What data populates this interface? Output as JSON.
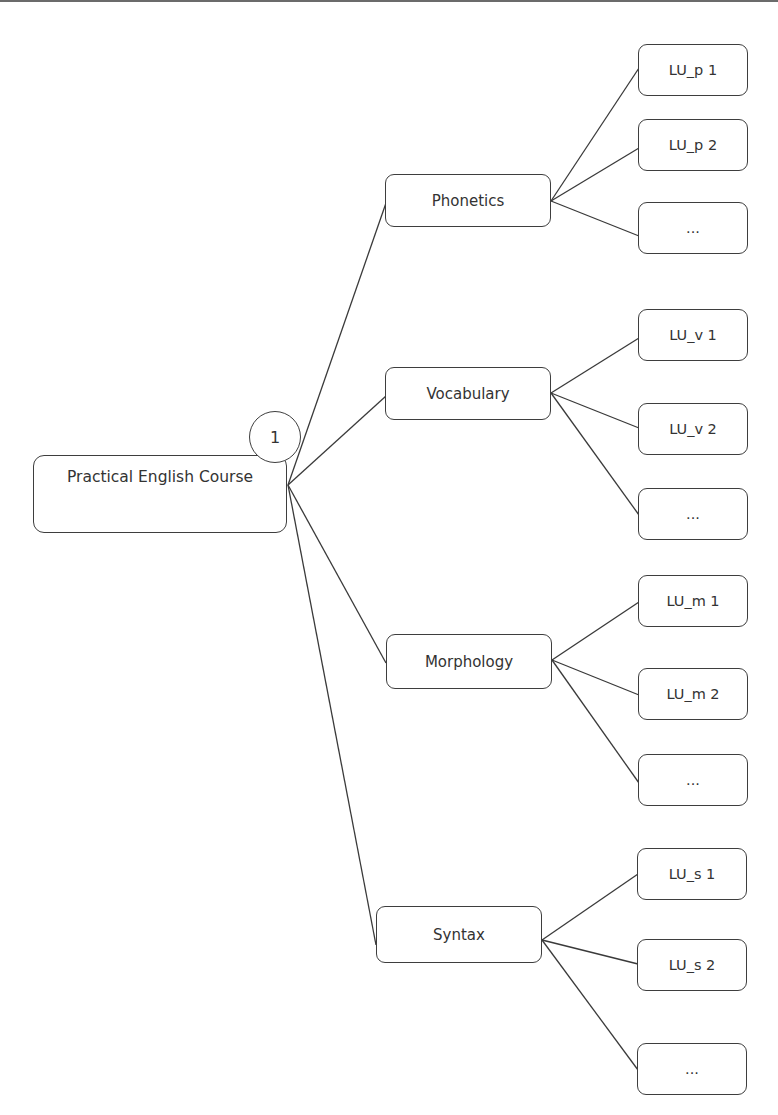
{
  "diagram": {
    "type": "tree",
    "root": {
      "label": "Practical English Course",
      "badge": "1",
      "box": {
        "x": 33,
        "y": 455,
        "w": 254,
        "h": 78
      },
      "badge_circle": {
        "cx": 275,
        "cy": 437,
        "r": 26
      }
    },
    "branches": [
      {
        "label": "Phonetics",
        "box": {
          "x": 385,
          "y": 174,
          "w": 166,
          "h": 53
        },
        "children": [
          {
            "label": "LU_p 1",
            "box": {
              "x": 638,
              "y": 44,
              "w": 110,
              "h": 52
            }
          },
          {
            "label": "LU_p 2",
            "box": {
              "x": 638,
              "y": 119,
              "w": 110,
              "h": 52
            }
          },
          {
            "label": "...",
            "box": {
              "x": 638,
              "y": 202,
              "w": 110,
              "h": 52
            }
          }
        ]
      },
      {
        "label": "Vocabulary",
        "box": {
          "x": 385,
          "y": 367,
          "w": 166,
          "h": 53
        },
        "children": [
          {
            "label": "LU_v 1",
            "box": {
              "x": 638,
              "y": 309,
              "w": 110,
              "h": 52
            }
          },
          {
            "label": "LU_v 2",
            "box": {
              "x": 638,
              "y": 403,
              "w": 110,
              "h": 52
            }
          },
          {
            "label": "...",
            "box": {
              "x": 638,
              "y": 488,
              "w": 110,
              "h": 52
            }
          }
        ]
      },
      {
        "label": "Morphology",
        "box": {
          "x": 386,
          "y": 634,
          "w": 166,
          "h": 55
        },
        "children": [
          {
            "label": "LU_m 1",
            "box": {
              "x": 638,
              "y": 575,
              "w": 110,
              "h": 52
            }
          },
          {
            "label": "LU_m 2",
            "box": {
              "x": 638,
              "y": 668,
              "w": 110,
              "h": 52
            }
          },
          {
            "label": "...",
            "box": {
              "x": 638,
              "y": 754,
              "w": 110,
              "h": 52
            }
          }
        ]
      },
      {
        "label": "Syntax",
        "box": {
          "x": 376,
          "y": 906,
          "w": 166,
          "h": 57
        },
        "children": [
          {
            "label": "LU_s 1",
            "box": {
              "x": 637,
              "y": 848,
              "w": 110,
              "h": 52
            }
          },
          {
            "label": "LU_s 2",
            "box": {
              "x": 637,
              "y": 939,
              "w": 110,
              "h": 52
            }
          },
          {
            "label": "...",
            "box": {
              "x": 637,
              "y": 1043,
              "w": 110,
              "h": 52
            }
          }
        ]
      }
    ],
    "colors": {
      "stroke": "#3e3e3e",
      "text": "#333333",
      "background": "#ffffff"
    }
  }
}
